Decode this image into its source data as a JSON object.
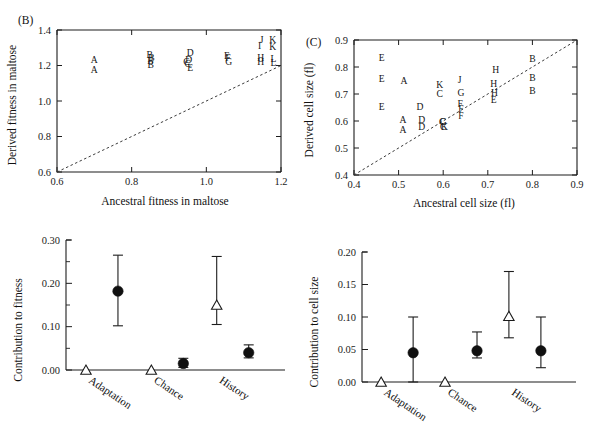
{
  "figure": {
    "background": "#ffffff",
    "ink": "#1a1a1a"
  },
  "panels": {
    "B": {
      "label": "(B)",
      "xlabel": "Ancestral fitness in maltose",
      "ylabel": "Derived fitness in maltose"
    },
    "C": {
      "label": "(C)",
      "xlabel": "Ancestral cell size (fl)",
      "ylabel": "Derived cell size (fl)"
    },
    "D": {
      "label": "",
      "xlabel": "",
      "ylabel": "Contribution to fitness"
    },
    "E": {
      "label": "",
      "xlabel": "",
      "ylabel": "Contribution to cell size"
    }
  },
  "chart_data": [
    {
      "id": "panel-B",
      "type": "scatter",
      "title": "(B)",
      "xlabel": "Ancestral fitness in maltose",
      "ylabel": "Derived fitness in maltose",
      "xlim": [
        0.6,
        1.2
      ],
      "ylim": [
        0.6,
        1.4
      ],
      "xticks": [
        0.6,
        0.8,
        1.0,
        1.2
      ],
      "xticklabels": [
        "0.6",
        "0.8",
        "1.0",
        "1.2"
      ],
      "yticks": [
        0.6,
        0.8,
        1.0,
        1.2,
        1.4
      ],
      "yticklabels": [
        "0.6",
        "0.8",
        "1.0",
        "1.2",
        "1.4"
      ],
      "grid": false,
      "legend": "none",
      "reference_line": {
        "kind": "identity",
        "style": "dashed",
        "from": [
          0.6,
          0.6
        ],
        "to": [
          1.2,
          1.2
        ]
      },
      "marker_style": "letter-glyph",
      "points": [
        {
          "label": "A",
          "x": 0.7,
          "y": 1.232
        },
        {
          "label": "A",
          "x": 0.7,
          "y": 1.178
        },
        {
          "label": "B",
          "x": 0.848,
          "y": 1.262
        },
        {
          "label": "B",
          "x": 0.853,
          "y": 1.245
        },
        {
          "label": "B",
          "x": 0.85,
          "y": 1.226
        },
        {
          "label": "B",
          "x": 0.851,
          "y": 1.205
        },
        {
          "label": "D",
          "x": 0.957,
          "y": 1.272
        },
        {
          "label": "D",
          "x": 0.953,
          "y": 1.234
        },
        {
          "label": "C",
          "x": 0.947,
          "y": 1.222
        },
        {
          "label": "C",
          "x": 0.95,
          "y": 1.21
        },
        {
          "label": "E",
          "x": 0.957,
          "y": 1.19
        },
        {
          "label": "E",
          "x": 1.055,
          "y": 1.258
        },
        {
          "label": "F",
          "x": 1.058,
          "y": 1.243
        },
        {
          "label": "G",
          "x": 1.06,
          "y": 1.222
        },
        {
          "label": "J",
          "x": 1.148,
          "y": 1.345
        },
        {
          "label": "K",
          "x": 1.178,
          "y": 1.345
        },
        {
          "label": "I",
          "x": 1.143,
          "y": 1.31
        },
        {
          "label": "K",
          "x": 1.178,
          "y": 1.305
        },
        {
          "label": "H",
          "x": 1.146,
          "y": 1.243
        },
        {
          "label": "H",
          "x": 1.146,
          "y": 1.222
        },
        {
          "label": "L",
          "x": 1.18,
          "y": 1.24
        },
        {
          "label": "L",
          "x": 1.18,
          "y": 1.218
        }
      ]
    },
    {
      "id": "panel-C",
      "type": "scatter",
      "title": "(C)",
      "xlabel": "Ancestral cell size (fl)",
      "ylabel": "Derived cell size (fl)",
      "xlim": [
        0.4,
        0.9
      ],
      "ylim": [
        0.4,
        0.9
      ],
      "xticks": [
        0.4,
        0.5,
        0.6,
        0.7,
        0.8,
        0.9
      ],
      "xticklabels": [
        "0.4",
        "0.5",
        "0.6",
        "0.7",
        "0.8",
        "0.9"
      ],
      "yticks": [
        0.4,
        0.5,
        0.6,
        0.7,
        0.8,
        0.9
      ],
      "yticklabels": [
        "0.4",
        "0.5",
        "0.6",
        "0.7",
        "0.8",
        "0.9"
      ],
      "grid": false,
      "legend": "none",
      "reference_line": {
        "kind": "identity",
        "style": "dashed",
        "from": [
          0.4,
          0.4
        ],
        "to": [
          0.9,
          0.9
        ]
      },
      "marker_style": "letter-glyph",
      "points": [
        {
          "label": "E",
          "x": 0.462,
          "y": 0.836
        },
        {
          "label": "E",
          "x": 0.462,
          "y": 0.757
        },
        {
          "label": "E",
          "x": 0.462,
          "y": 0.652
        },
        {
          "label": "A",
          "x": 0.512,
          "y": 0.75
        },
        {
          "label": "A",
          "x": 0.51,
          "y": 0.605
        },
        {
          "label": "A",
          "x": 0.51,
          "y": 0.57
        },
        {
          "label": "D",
          "x": 0.548,
          "y": 0.655
        },
        {
          "label": "D",
          "x": 0.552,
          "y": 0.605
        },
        {
          "label": "D",
          "x": 0.552,
          "y": 0.58
        },
        {
          "label": "K",
          "x": 0.592,
          "y": 0.733
        },
        {
          "label": "C",
          "x": 0.592,
          "y": 0.7
        },
        {
          "label": "C",
          "x": 0.598,
          "y": 0.598
        },
        {
          "label": "C",
          "x": 0.6,
          "y": 0.58
        },
        {
          "label": "G",
          "x": 0.6,
          "y": 0.598
        },
        {
          "label": "K",
          "x": 0.603,
          "y": 0.578
        },
        {
          "label": "J",
          "x": 0.637,
          "y": 0.752
        },
        {
          "label": "G",
          "x": 0.64,
          "y": 0.706
        },
        {
          "label": "F",
          "x": 0.638,
          "y": 0.665
        },
        {
          "label": "F",
          "x": 0.64,
          "y": 0.645
        },
        {
          "label": "F",
          "x": 0.64,
          "y": 0.62
        },
        {
          "label": "H",
          "x": 0.718,
          "y": 0.79
        },
        {
          "label": "H",
          "x": 0.713,
          "y": 0.74
        },
        {
          "label": "H",
          "x": 0.715,
          "y": 0.705
        },
        {
          "label": "E",
          "x": 0.713,
          "y": 0.678
        },
        {
          "label": "B",
          "x": 0.8,
          "y": 0.83
        },
        {
          "label": "B",
          "x": 0.8,
          "y": 0.76
        },
        {
          "label": "B",
          "x": 0.8,
          "y": 0.712
        }
      ]
    },
    {
      "id": "panel-D",
      "type": "scatter",
      "title": "",
      "xlabel": "",
      "ylabel": "Contribution to fitness",
      "ylim": [
        0.0,
        0.3
      ],
      "yticks": [
        0.0,
        0.1,
        0.2,
        0.3
      ],
      "yticklabels": [
        "0.00",
        "0.10",
        "0.20",
        "0.30"
      ],
      "minor_yticks": [
        0.05,
        0.15,
        0.25
      ],
      "categories": [
        "Adaptation",
        "Chance",
        "History"
      ],
      "grid": false,
      "legend": "none",
      "series": [
        {
          "name": "open-triangle",
          "marker": "open-triangle",
          "values": [
            0.0,
            0.0,
            0.15
          ],
          "err_low": [
            0.0,
            0.0,
            0.105
          ],
          "err_high": [
            0.0,
            0.0,
            0.262
          ]
        },
        {
          "name": "filled-circle",
          "marker": "filled-circle",
          "values": [
            0.182,
            0.015,
            0.04
          ],
          "err_low": [
            0.102,
            0.006,
            0.028
          ],
          "err_high": [
            0.265,
            0.027,
            0.058
          ]
        }
      ]
    },
    {
      "id": "panel-E",
      "type": "scatter",
      "title": "",
      "xlabel": "",
      "ylabel": "Contribution to cell size",
      "ylim": [
        0.0,
        0.2
      ],
      "yticks": [
        0.0,
        0.05,
        0.1,
        0.15,
        0.2
      ],
      "yticklabels": [
        "0.00",
        "0.05",
        "0.10",
        "0.15",
        "0.20"
      ],
      "categories": [
        "Adaptation",
        "Chance",
        "History"
      ],
      "grid": false,
      "legend": "none",
      "series": [
        {
          "name": "open-triangle",
          "marker": "open-triangle",
          "values": [
            0.0,
            0.0,
            0.101
          ],
          "err_low": [
            0.0,
            0.0,
            0.068
          ],
          "err_high": [
            0.0,
            0.0,
            0.17
          ]
        },
        {
          "name": "filled-circle",
          "marker": "filled-circle",
          "values": [
            0.045,
            0.048,
            0.048
          ],
          "err_low": [
            0.0,
            0.037,
            0.022
          ],
          "err_high": [
            0.1,
            0.077,
            0.1
          ]
        }
      ]
    }
  ]
}
